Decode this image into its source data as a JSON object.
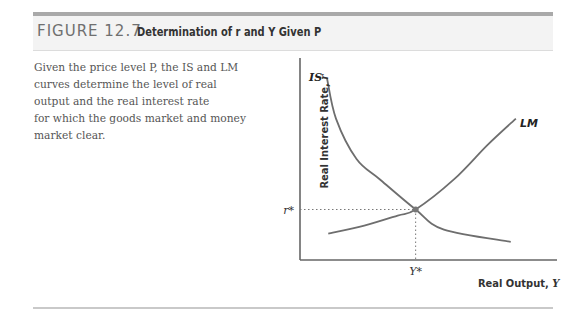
{
  "figure": {
    "number": "FIGURE 12.7",
    "title": "Determination of r and Y Given P"
  },
  "caption": [
    "Given the price level P, the IS and LM",
    "curves determine the level of real",
    "output and the real interest rate",
    "for which the goods market and money",
    "market clear."
  ],
  "chart_data": {
    "type": "line",
    "title": "Determination of r and Y Given P",
    "xlabel": "Real Output, Y",
    "ylabel": "Real Interest Rate, r",
    "xlabel_text": "Real Output, ",
    "xlabel_var": "Y",
    "ylabel_text": "Real Interest Rate, ",
    "ylabel_var": "r",
    "xlim": [
      0,
      100
    ],
    "ylim": [
      0,
      100
    ],
    "grid": false,
    "ticks": false,
    "series": [
      {
        "name": "IS",
        "label": "IS",
        "shape": "downward-sloping convex",
        "points": [
          [
            10.5,
            90
          ],
          [
            14,
            70
          ],
          [
            22,
            50
          ],
          [
            31,
            40
          ],
          [
            45,
            25
          ],
          [
            56,
            15
          ],
          [
            82,
            9
          ]
        ]
      },
      {
        "name": "LM",
        "label": "LM",
        "shape": "upward-sloping convex",
        "points": [
          [
            11,
            13
          ],
          [
            25,
            17
          ],
          [
            38,
            22
          ],
          [
            45,
            25
          ],
          [
            60,
            40
          ],
          [
            73,
            57
          ],
          [
            84,
            70
          ]
        ]
      }
    ],
    "equilibrium": {
      "x": 45,
      "y": 25,
      "x_label": "Y*",
      "y_label": "r*"
    },
    "annotations": [
      "r*",
      "Y*",
      "IS",
      "LM"
    ]
  }
}
